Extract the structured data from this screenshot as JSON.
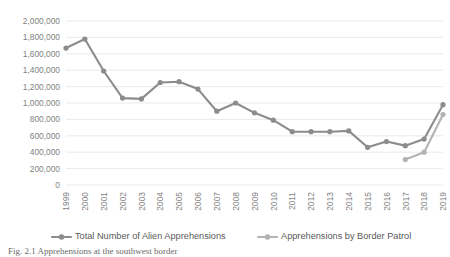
{
  "chart_data": {
    "type": "line",
    "title": "",
    "xlabel": "",
    "ylabel": "",
    "grid": true,
    "legend_position": "bottom",
    "ylim": [
      0,
      2000000
    ],
    "ytick_step": 200000,
    "ytick_labels": [
      "2,000,000",
      "1,800,000",
      "1,600,000",
      "1,400,000",
      "1,200,000",
      "1,000,000",
      "800,000",
      "600,000",
      "400,000",
      "200,000",
      "0"
    ],
    "ytick_values": [
      2000000,
      1800000,
      1600000,
      1400000,
      1200000,
      1000000,
      800000,
      600000,
      400000,
      200000,
      0
    ],
    "categories": [
      "1999",
      "2000",
      "2001",
      "2002",
      "2003",
      "2004",
      "2005",
      "2006",
      "2007",
      "2008",
      "2009",
      "2010",
      "2011",
      "2012",
      "2013",
      "2014",
      "2015",
      "2016",
      "2017",
      "2018",
      "2019"
    ],
    "series": [
      {
        "name": "Total Number of Alien Apprehensions",
        "color": "#8c8c8c",
        "values": [
          1670000,
          1780000,
          1390000,
          1060000,
          1050000,
          1250000,
          1260000,
          1170000,
          900000,
          1000000,
          880000,
          790000,
          650000,
          650000,
          650000,
          660000,
          460000,
          530000,
          480000,
          560000,
          980000
        ]
      },
      {
        "name": "Apprehensions by Border Patrol",
        "color": "#b3b3b3",
        "values": [
          null,
          null,
          null,
          null,
          null,
          null,
          null,
          null,
          null,
          null,
          null,
          null,
          null,
          null,
          null,
          null,
          null,
          null,
          310000,
          400000,
          860000
        ]
      }
    ]
  },
  "legend": {
    "items": [
      {
        "label": "Total Number of Alien Apprehensions",
        "color": "#8c8c8c"
      },
      {
        "label": "Apprehensions by Border Patrol",
        "color": "#b3b3b3"
      }
    ]
  },
  "caption": {
    "text": "Fig. 2.1 Apprehensions at the southwest border"
  }
}
